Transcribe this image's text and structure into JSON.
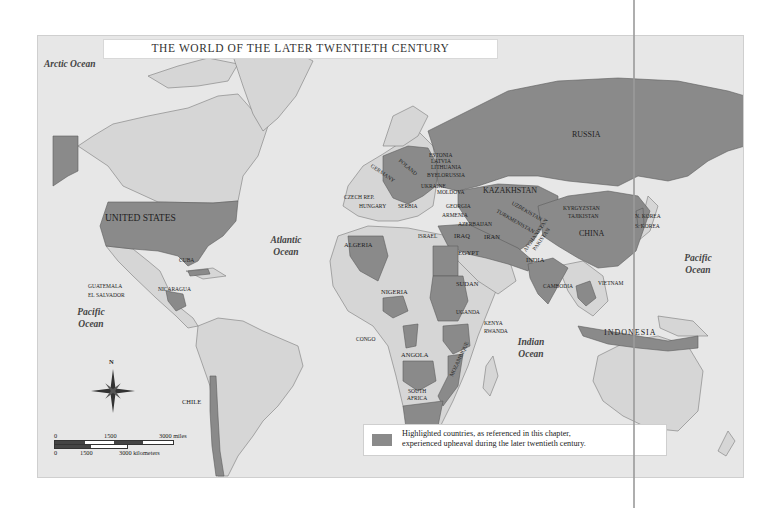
{
  "map": {
    "title": "THE WORLD OF THE LATER TWENTIETH CENTURY",
    "colors": {
      "ocean": "#e7e7e7",
      "land": "#d6d6d6",
      "highlighted": "#8a8a8a",
      "border": "#7a7a7a"
    },
    "oceans": {
      "arctic": "Arctic Ocean",
      "atlantic_1": "Atlantic",
      "atlantic_2": "Ocean",
      "pacific_w_1": "Pacific",
      "pacific_w_2": "Ocean",
      "pacific_e_1": "Pacific",
      "pacific_e_2": "Ocean",
      "indian_1": "Indian",
      "indian_2": "Ocean"
    },
    "countries": {
      "united_states": "United States",
      "cuba": "Cuba",
      "guatemala": "Guatemala",
      "el_salvador": "El Salvador",
      "nicaragua": "Nicaragua",
      "chile": "Chile",
      "russia": "Russia",
      "estonia": "Estonia",
      "latvia": "Latvia",
      "lithuania": "Lithuania",
      "byelorussia": "Byelorussia",
      "ukraine": "Ukraine",
      "moldova": "Moldova",
      "germany": "Germany",
      "poland": "Poland",
      "czech_rep": "Czech Rep.",
      "hungary": "Hungary",
      "serbia": "Serbia",
      "georgia": "Georgia",
      "armenia": "Armenia",
      "azerbaijan": "Azerbaijan",
      "kazakhstan": "Kazakhstan",
      "uzbekistan": "Uzbekistan",
      "turkmenistan": "Turkmenistan",
      "kyrgyzstan": "Kyrgyzstan",
      "tajikistan": "Tajikistan",
      "afghanistan": "Afghanistan",
      "pakistan": "Pakistan",
      "iran": "Iran",
      "iraq": "Iraq",
      "israel": "Israel",
      "india": "India",
      "china": "China",
      "n_korea": "N. Korea",
      "s_korea": "S. Korea",
      "cambodia": "Cambodia",
      "vietnam": "Vietnam",
      "indonesia": "Indonesia",
      "algeria": "Algeria",
      "egypt": "Egypt",
      "sudan": "Sudan",
      "nigeria": "Nigeria",
      "uganda": "Uganda",
      "kenya": "Kenya",
      "rwanda": "Rwanda",
      "congo": "Congo",
      "angola": "Angola",
      "mozambique": "Mozambique",
      "south_africa_1": "South",
      "south_africa_2": "Africa"
    },
    "compass": {
      "north": "N"
    },
    "scale": {
      "miles_0": "0",
      "miles_mid": "1500",
      "miles_max": "3000 miles",
      "km_0": "0",
      "km_mid": "1500",
      "km_max": "3000 kilometers"
    },
    "legend": {
      "line1": "Highlighted countries, as referenced in this chapter,",
      "line2": "experienced upheaval during the later twentieth century."
    }
  }
}
